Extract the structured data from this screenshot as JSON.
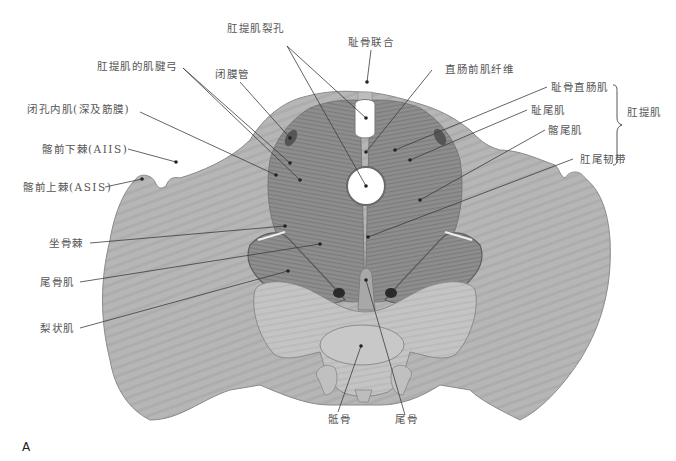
{
  "figure": {
    "panel_letter": "A",
    "color_mode": "grayscale",
    "bone_color": "#b4b4b4",
    "muscle_color": "#8a8a8a",
    "line_color": "#444444"
  },
  "labels": {
    "levator_hiatus": "肛提肌裂孔",
    "pubic_symphysis": "耻骨联合",
    "tendinous_arch": "肛提肌的肌腱弓",
    "obturator_canal": "闭膜管",
    "prerectal_fibers": "直肠前肌纤维",
    "obturator_internus": "闭孔内肌(深及筋膜)",
    "puborectalis": "耻骨直肠肌",
    "pubococcygeus": "耻尾肌",
    "levator_ani_group": "肛提肌",
    "aiis": "髂前下棘(AIIS)",
    "iliococcygeus": "髂尾肌",
    "anococcygeal_ligament": "肛尾韧带",
    "asis": "髂前上棘(ASIS)",
    "ischial_spine": "坐骨棘",
    "coccygeus": "尾骨肌",
    "piriformis": "梨状肌",
    "sacrum": "骶骨",
    "coccyx": "尾骨"
  }
}
